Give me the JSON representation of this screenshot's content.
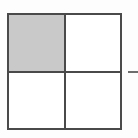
{
  "figure": {
    "background_color": "#fdfdfd",
    "square": {
      "border_color": "#4a4a4a",
      "fill_color": "#ffffff",
      "shaded_fill_color": "#c9c9c9",
      "rows": 2,
      "columns": 2,
      "shaded_fraction": "1/4"
    },
    "quadrants": [
      {
        "id": "top-left",
        "label": "",
        "shaded": "shaded",
        "fill": "#c9c9c9"
      },
      {
        "id": "top-right",
        "label": "",
        "shaded": "unshaded",
        "fill": "#ffffff"
      },
      {
        "id": "bottom-left",
        "label": "",
        "shaded": "unshaded",
        "fill": "#ffffff"
      },
      {
        "id": "bottom-right",
        "label": "",
        "shaded": "unshaded",
        "fill": "#ffffff"
      }
    ],
    "leader_line": {
      "label": "",
      "color": "#6d6d6d",
      "orientation": "horizontal"
    }
  }
}
